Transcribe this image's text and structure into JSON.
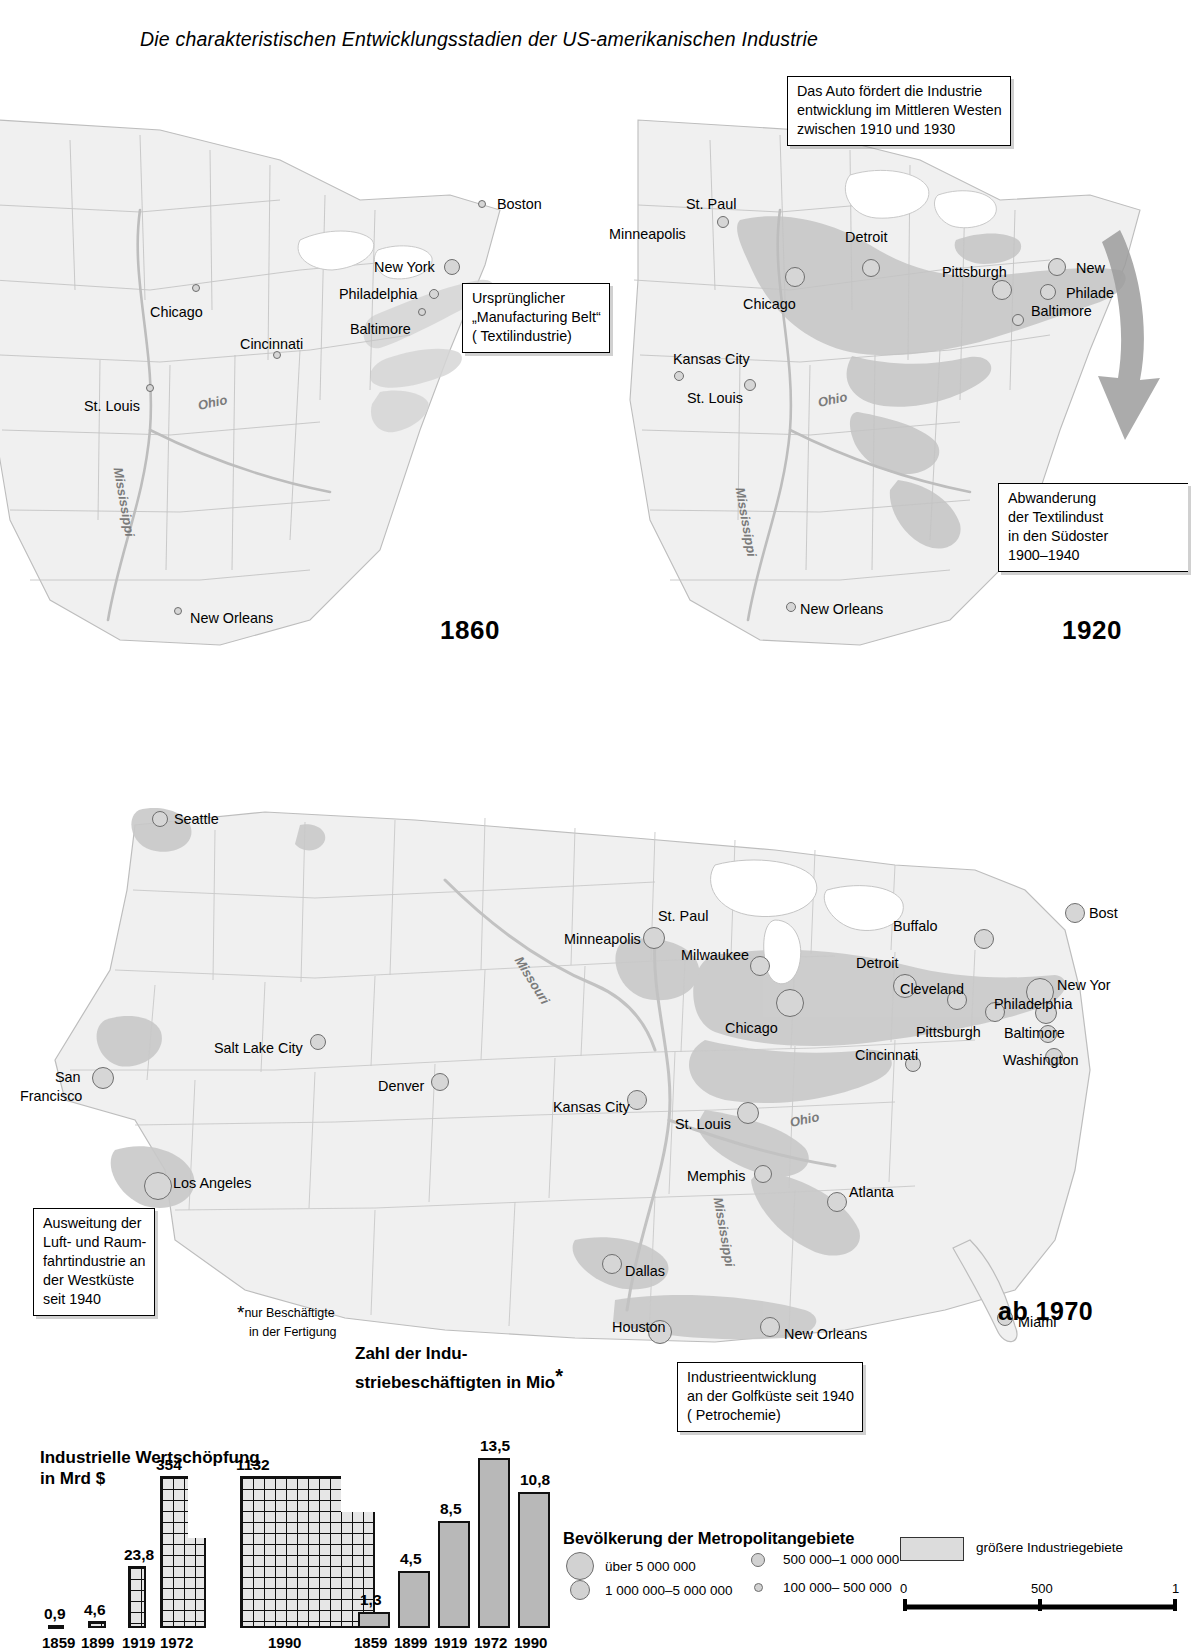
{
  "title": "Die charakteristischen Entwicklungsstadien der US-amerikanischen Industrie",
  "maps": [
    {
      "id": "1860",
      "year_label": "1860",
      "cities": [
        {
          "name": "Boston",
          "x": 497,
          "y": 197,
          "cx": 482,
          "cy": 204,
          "r": 4
        },
        {
          "name": "New York",
          "x": 374,
          "y": 260,
          "cx": 452,
          "cy": 267,
          "r": 8
        },
        {
          "name": "Philadelphia",
          "x": 339,
          "y": 287,
          "cx": 434,
          "cy": 294,
          "r": 5
        },
        {
          "name": "Baltimore",
          "x": 350,
          "y": 322,
          "cx": 422,
          "cy": 312,
          "r": 4
        },
        {
          "name": "Chicago",
          "x": 150,
          "y": 305,
          "cx": 196,
          "cy": 288,
          "r": 4
        },
        {
          "name": "Cincinnati",
          "x": 240,
          "y": 337,
          "cx": 277,
          "cy": 355,
          "r": 4
        },
        {
          "name": "St. Louis",
          "x": 84,
          "y": 399,
          "cx": 150,
          "cy": 388,
          "r": 4
        },
        {
          "name": "New Orleans",
          "x": 190,
          "y": 611,
          "cx": 178,
          "cy": 611,
          "r": 4
        }
      ],
      "rivers": [
        {
          "name": "Ohio",
          "x": 198,
          "y": 398,
          "rot": -12
        },
        {
          "name": "Mississippi",
          "x": 118,
          "y": 460,
          "rot": 80
        }
      ],
      "callouts": [
        {
          "id": "belt",
          "lines": [
            "Ursprünglicher",
            "„Manufacturing Belt“",
            "( Textilindustrie)"
          ]
        }
      ]
    },
    {
      "id": "1920",
      "year_label": "1920",
      "cities": [
        {
          "name": "St. Paul",
          "x": 686,
          "y": 197,
          "cx": 723,
          "cy": 222,
          "r": 6
        },
        {
          "name": "Minneapolis",
          "x": 609,
          "y": 227,
          "cx": 723,
          "cy": 222,
          "r": 0
        },
        {
          "name": "Detroit",
          "x": 845,
          "y": 230,
          "cx": 871,
          "cy": 268,
          "r": 9
        },
        {
          "name": "Chicago",
          "x": 743,
          "y": 297,
          "cx": 795,
          "cy": 277,
          "r": 10
        },
        {
          "name": "Pittsburgh",
          "x": 942,
          "y": 265,
          "cx": 1002,
          "cy": 290,
          "r": 10
        },
        {
          "name": "New",
          "x": 1076,
          "y": 261,
          "cx": 1057,
          "cy": 267,
          "r": 9
        },
        {
          "name": "Philade",
          "x": 1066,
          "y": 286,
          "cx": 1048,
          "cy": 292,
          "r": 8
        },
        {
          "name": "Baltimore",
          "x": 1031,
          "y": 304,
          "cx": 1018,
          "cy": 320,
          "r": 6
        },
        {
          "name": "Kansas City",
          "x": 673,
          "y": 352,
          "cx": 679,
          "cy": 376,
          "r": 5
        },
        {
          "name": "St. Louis",
          "x": 687,
          "y": 391,
          "cx": 750,
          "cy": 385,
          "r": 6
        },
        {
          "name": "New Orleans",
          "x": 800,
          "y": 602,
          "cx": 791,
          "cy": 607,
          "r": 5
        }
      ],
      "rivers": [
        {
          "name": "Ohio",
          "x": 818,
          "y": 395,
          "rot": -12
        },
        {
          "name": "Mississippi",
          "x": 740,
          "y": 480,
          "rot": 80
        }
      ],
      "callouts": [
        {
          "id": "auto",
          "lines": [
            "Das Auto fördert die Industrie",
            "entwicklung im Mittleren Westen",
            "zwischen 1910 und 1930"
          ]
        },
        {
          "id": "textil",
          "lines": [
            "Abwanderung",
            "der Textilindust",
            "in den Südoster",
            "1900–1940"
          ]
        }
      ]
    },
    {
      "id": "1970",
      "year_label": "ab 1970",
      "cities": [
        {
          "name": "Seattle",
          "x": 174,
          "y": 812,
          "cx": 160,
          "cy": 819,
          "r": 8
        },
        {
          "name": "St. Paul",
          "x": 658,
          "y": 909,
          "cx": 654,
          "cy": 938,
          "r": 11
        },
        {
          "name": "Minneapolis",
          "x": 564,
          "y": 932,
          "cx": 654,
          "cy": 938,
          "r": 0
        },
        {
          "name": "Milwaukee",
          "x": 681,
          "y": 948,
          "cx": 760,
          "cy": 966,
          "r": 10
        },
        {
          "name": "Buffalo",
          "x": 893,
          "y": 919,
          "cx": 984,
          "cy": 939,
          "r": 10
        },
        {
          "name": "Detroit",
          "x": 856,
          "y": 956,
          "cx": 905,
          "cy": 986,
          "r": 12
        },
        {
          "name": "Cleveland",
          "x": 900,
          "y": 982,
          "cx": 957,
          "cy": 1000,
          "r": 10
        },
        {
          "name": "Chicago",
          "x": 725,
          "y": 1021,
          "cx": 790,
          "cy": 1003,
          "r": 14
        },
        {
          "name": "Pittsburgh",
          "x": 916,
          "y": 1025,
          "cx": 995,
          "cy": 1012,
          "r": 10
        },
        {
          "name": "New Yor",
          "x": 1057,
          "y": 978,
          "cx": 1040,
          "cy": 992,
          "r": 14
        },
        {
          "name": "Philadelphia",
          "x": 994,
          "y": 997,
          "cx": 1046,
          "cy": 1013,
          "r": 11
        },
        {
          "name": "Baltimore",
          "x": 1004,
          "y": 1026,
          "cx": 1048,
          "cy": 1034,
          "r": 9
        },
        {
          "name": "Washington",
          "x": 1003,
          "y": 1053,
          "cx": 1054,
          "cy": 1057,
          "r": 9
        },
        {
          "name": "Cincinnati",
          "x": 855,
          "y": 1048,
          "cx": 913,
          "cy": 1064,
          "r": 8
        },
        {
          "name": "Salt Lake City",
          "x": 214,
          "y": 1041,
          "cx": 318,
          "cy": 1042,
          "r": 8
        },
        {
          "name": "San",
          "x": 55,
          "y": 1070,
          "cx": 103,
          "cy": 1078,
          "r": 11
        },
        {
          "name": "Francisco",
          "x": 20,
          "y": 1089,
          "cx": 103,
          "cy": 1078,
          "r": 0
        },
        {
          "name": "Denver",
          "x": 378,
          "y": 1079,
          "cx": 440,
          "cy": 1082,
          "r": 9
        },
        {
          "name": "Kansas City",
          "x": 553,
          "y": 1100,
          "cx": 637,
          "cy": 1100,
          "r": 10
        },
        {
          "name": "St. Louis",
          "x": 675,
          "y": 1117,
          "cx": 748,
          "cy": 1113,
          "r": 11
        },
        {
          "name": "Los Angeles",
          "x": 173,
          "y": 1176,
          "cx": 158,
          "cy": 1186,
          "r": 14
        },
        {
          "name": "Memphis",
          "x": 687,
          "y": 1169,
          "cx": 763,
          "cy": 1174,
          "r": 9
        },
        {
          "name": "Atlanta",
          "x": 849,
          "y": 1185,
          "cx": 837,
          "cy": 1202,
          "r": 10
        },
        {
          "name": "Dallas",
          "x": 625,
          "y": 1264,
          "cx": 612,
          "cy": 1264,
          "r": 10
        },
        {
          "name": "Houston",
          "x": 612,
          "y": 1320,
          "cx": 660,
          "cy": 1332,
          "r": 12
        },
        {
          "name": "New Orleans",
          "x": 784,
          "y": 1327,
          "cx": 770,
          "cy": 1327,
          "r": 10
        },
        {
          "name": "Miami",
          "x": 1018,
          "y": 1315,
          "cx": 1005,
          "cy": 1318,
          "r": 8
        },
        {
          "name": "Bost",
          "x": 1089,
          "y": 906,
          "cx": 1075,
          "cy": 913,
          "r": 10
        }
      ],
      "rivers": [
        {
          "name": "Missouri",
          "x": 518,
          "y": 950,
          "rot": 58
        },
        {
          "name": "Ohio",
          "x": 790,
          "y": 1115,
          "rot": -12
        },
        {
          "name": "Mississippi",
          "x": 718,
          "y": 1190,
          "rot": 80
        }
      ],
      "callouts": [
        {
          "id": "west",
          "lines": [
            "Ausweitung der",
            "Luft- und Raum-",
            "fahrtindustrie an",
            "der Westküste",
            "seit 1940"
          ]
        },
        {
          "id": "gulf",
          "lines": [
            "Industrieentwicklung",
            "an der Golfküste seit 1940",
            "( Petrochemie)"
          ]
        }
      ]
    }
  ],
  "charts": {
    "footnote": {
      "star": "*",
      "lines": [
        "nur Beschäftigte",
        "in der Fertigung"
      ]
    },
    "value_added": {
      "type": "bar",
      "title_lines": [
        "Industrielle Wertschöpfung",
        "in Mrd $"
      ],
      "unit": "Mrd $",
      "categories": [
        "1859",
        "1899",
        "1919",
        "1972",
        "1990"
      ],
      "values": [
        0.9,
        4.6,
        23.8,
        354,
        1132
      ],
      "value_labels": [
        "0,9",
        "4,6",
        "23,8",
        "354",
        "1132"
      ]
    },
    "employees": {
      "type": "bar",
      "title_lines": [
        "Zahl der Indu-",
        "striebeschäftigten in Mio"
      ],
      "unit": "Mio",
      "categories": [
        "1859",
        "1899",
        "1919",
        "1972",
        "1990"
      ],
      "values": [
        1.3,
        4.5,
        8.5,
        13.5,
        10.8
      ],
      "value_labels": [
        "1,3",
        "4,5",
        "8,5",
        "13,5",
        "10,8"
      ]
    }
  },
  "legend": {
    "population_title": "Bevölkerung der Metropolitangebiete",
    "classes": [
      {
        "label": "über   5 000 000",
        "r": 13
      },
      {
        "label": "1 000 000–5 000 000",
        "r": 9
      },
      {
        "label": "500 000–1 000 000",
        "r": 6
      },
      {
        "label": "100 000–  500 000",
        "r": 3.5
      }
    ],
    "area_label": "größere Industriegebiete",
    "scale": {
      "ticks": [
        "0",
        "500",
        "1"
      ]
    }
  },
  "colors": {
    "land": "#f0f0f0",
    "border": "#b4b4b4",
    "industry_area": "#c9c9c9",
    "city_fill": "#d6d6d6",
    "city_stroke": "#6e6e6e",
    "ink": "#000000"
  }
}
